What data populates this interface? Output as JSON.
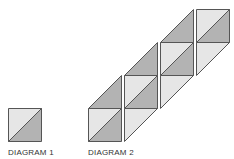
{
  "colors": {
    "light": "#e6e6e6",
    "dark": "#b3b3b3",
    "stroke": "#555555"
  },
  "labels": {
    "diagram1": "DIAGRAM 1",
    "diagram2": "DIAGRAM 2"
  },
  "diagram1": {
    "square": {
      "x": 8,
      "y": 108,
      "size": 33
    }
  },
  "diagram2": {
    "columns": 4,
    "cell": 33
  }
}
